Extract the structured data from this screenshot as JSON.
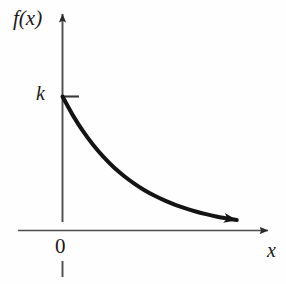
{
  "figure": {
    "background_color": "#fefefe",
    "axis_color": "#4d4d4d",
    "curve_color": "#141414",
    "text_color": "#1a1a1a",
    "labels": {
      "y_axis": "f(x)",
      "x_axis": "x",
      "origin": "0",
      "intercept": "k"
    }
  },
  "chart_data": {
    "type": "line",
    "title": "",
    "subtitle": "",
    "xlabel": "x",
    "ylabel": "f(x)",
    "function": "f(x) = k·e^(-λx)",
    "grid": false,
    "legend": null,
    "xlim": [
      0,
      1
    ],
    "ylim": [
      0,
      1.15
    ],
    "axis_ticks": {
      "x": [
        "0"
      ],
      "y": [
        "k"
      ]
    },
    "annotations": [
      {
        "text": "k",
        "type": "y-intercept-tick",
        "x": 0,
        "y": 1.0
      },
      {
        "text": "0",
        "type": "origin",
        "x": 0,
        "y": 0
      }
    ],
    "series": [
      {
        "name": "f(x) = k·e^(-λx)",
        "x": [
          0.0,
          0.05,
          0.1,
          0.15,
          0.2,
          0.25,
          0.3,
          0.35,
          0.4,
          0.45,
          0.5,
          0.55,
          0.6,
          0.65,
          0.7,
          0.75,
          0.8,
          0.85
        ],
        "y": [
          1.0,
          0.861,
          0.741,
          0.638,
          0.549,
          0.472,
          0.407,
          0.35,
          0.301,
          0.259,
          0.223,
          0.192,
          0.165,
          0.142,
          0.122,
          0.105,
          0.091,
          0.078
        ],
        "arrow_end": true,
        "line_width": 4
      }
    ]
  }
}
